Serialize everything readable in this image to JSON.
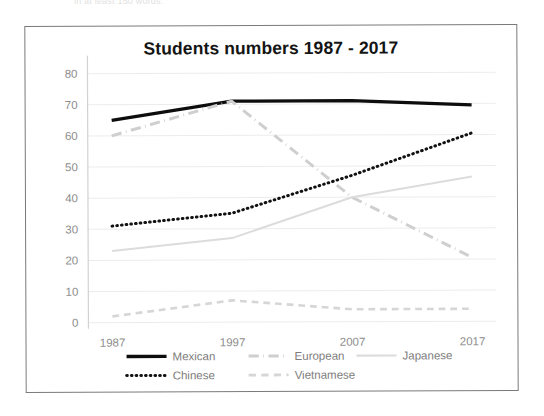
{
  "page": {
    "scan_top_text": "in at least 150 words."
  },
  "chart_data": {
    "type": "line",
    "title": "Students numbers 1987 - 2017",
    "xlabel": "",
    "ylabel": "",
    "categories": [
      "1987",
      "1997",
      "2007",
      "2017"
    ],
    "x_tick_labels": [
      "1987",
      "1997",
      "2007",
      "2017"
    ],
    "y_tick_labels": [
      "0",
      "10",
      "20",
      "30",
      "40",
      "50",
      "60",
      "70",
      "80"
    ],
    "ylim": [
      0,
      80
    ],
    "y_step": 10,
    "grid": true,
    "legend_position": "bottom",
    "series": [
      {
        "name": "Mexican",
        "values": [
          65,
          71,
          71,
          69.5
        ],
        "color": "#0d0d0d",
        "style": "solid",
        "width": 3.2
      },
      {
        "name": "European",
        "values": [
          60,
          71,
          40,
          20.5
        ],
        "color": "#cfcfcf",
        "style": "dash-dot",
        "width": 3.0
      },
      {
        "name": "Japanese",
        "values": [
          23,
          27,
          40,
          46.5
        ],
        "color": "#dcdcdc",
        "style": "solid",
        "width": 2.0
      },
      {
        "name": "Chinese",
        "values": [
          31,
          35,
          47,
          60.5
        ],
        "color": "#121212",
        "style": "dotted",
        "width": 3.0
      },
      {
        "name": "Vietnamese",
        "values": [
          2,
          7,
          4,
          4
        ],
        "color": "#d6d6d6",
        "style": "dashed",
        "width": 2.6
      }
    ],
    "legend": [
      {
        "label": "Mexican",
        "color": "#0d0d0d",
        "style": "solid",
        "width": 3.4
      },
      {
        "label": "European",
        "color": "#cfcfcf",
        "style": "dash-dot",
        "width": 3.0
      },
      {
        "label": "Japanese",
        "color": "#dcdcdc",
        "style": "solid",
        "width": 2.2
      },
      {
        "label": "Chinese",
        "color": "#121212",
        "style": "dotted",
        "width": 3.0
      },
      {
        "label": "Vietnamese",
        "color": "#d6d6d6",
        "style": "dashed",
        "width": 2.8
      }
    ]
  }
}
